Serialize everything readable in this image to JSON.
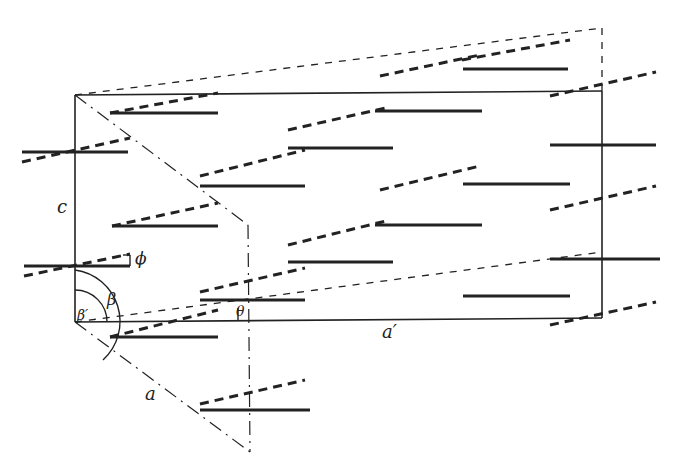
{
  "figure": {
    "type": "crystal-lattice-projection",
    "labels": {
      "c": "c",
      "a": "a",
      "a_prime": "a′",
      "beta": "β",
      "beta_prime": "β′",
      "theta": "θ",
      "phi": "ϕ"
    },
    "colors": {
      "ink": "#222222",
      "background": "#ffffff"
    },
    "lines": {
      "cell_solid": "solid",
      "projection_dashed": "dashed",
      "oblique_axis": "dash-dot"
    }
  }
}
